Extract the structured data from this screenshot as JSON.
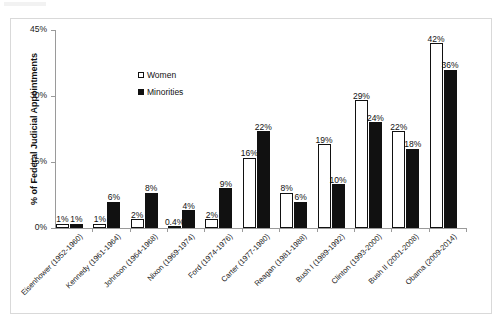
{
  "figure": {
    "has_outer_frame": true,
    "background_color": "#ffffff"
  },
  "legend": {
    "position": "inside-top-left",
    "entries": [
      {
        "label": "Women",
        "swatch": "white-square-outline",
        "color": "#ffffff"
      },
      {
        "label": "Minorities",
        "swatch": "black-filled-square",
        "color": "#111111"
      }
    ]
  },
  "axes": {
    "ylabel": "% of Federal Judicial Appointments",
    "yticks": [
      "0%",
      "15%",
      "30%",
      "45%"
    ],
    "ytick_values": [
      0,
      15,
      30,
      45
    ],
    "ymin": 0,
    "ymax": 45,
    "xlabel": ""
  },
  "chart_data": {
    "type": "bar",
    "title": "",
    "xlabel": "",
    "ylabel": "% of Federal Judicial Appointments",
    "ylim": [
      0,
      45
    ],
    "ytick_labels": [
      "0%",
      "15%",
      "30%",
      "45%"
    ],
    "grid": false,
    "legend_position": "upper left (inside plot)",
    "categories": [
      "Eisenhower (1952-1960)",
      "Kennedy (1961-1964)",
      "Johnson (1964-1968)",
      "Nixon (1969-1974)",
      "Ford (1974-1976)",
      "Carter (1977-1980)",
      "Reagan (1981-1988)",
      "Bush I (1989-1992)",
      "Clinton (1993-2000)",
      "Bush II (2001-2008)",
      "Obama (2009-2014)"
    ],
    "series": [
      {
        "name": "Women",
        "color": "#ffffff",
        "values": [
          1,
          1,
          2,
          0.4,
          2,
          16,
          8,
          19,
          29,
          22,
          42
        ],
        "labels": [
          "1%",
          "1%",
          "2%",
          "0.4%",
          "2%",
          "16%",
          "8%",
          "19%",
          "29%",
          "22%",
          "42%"
        ]
      },
      {
        "name": "Minorities",
        "color": "#111111",
        "values": [
          1,
          6,
          8,
          4,
          9,
          22,
          6,
          10,
          24,
          18,
          36
        ],
        "labels": [
          "1%",
          "6%",
          "8%",
          "4%",
          "9%",
          "22%",
          "6%",
          "10%",
          "24%",
          "18%",
          "36%"
        ]
      }
    ]
  }
}
